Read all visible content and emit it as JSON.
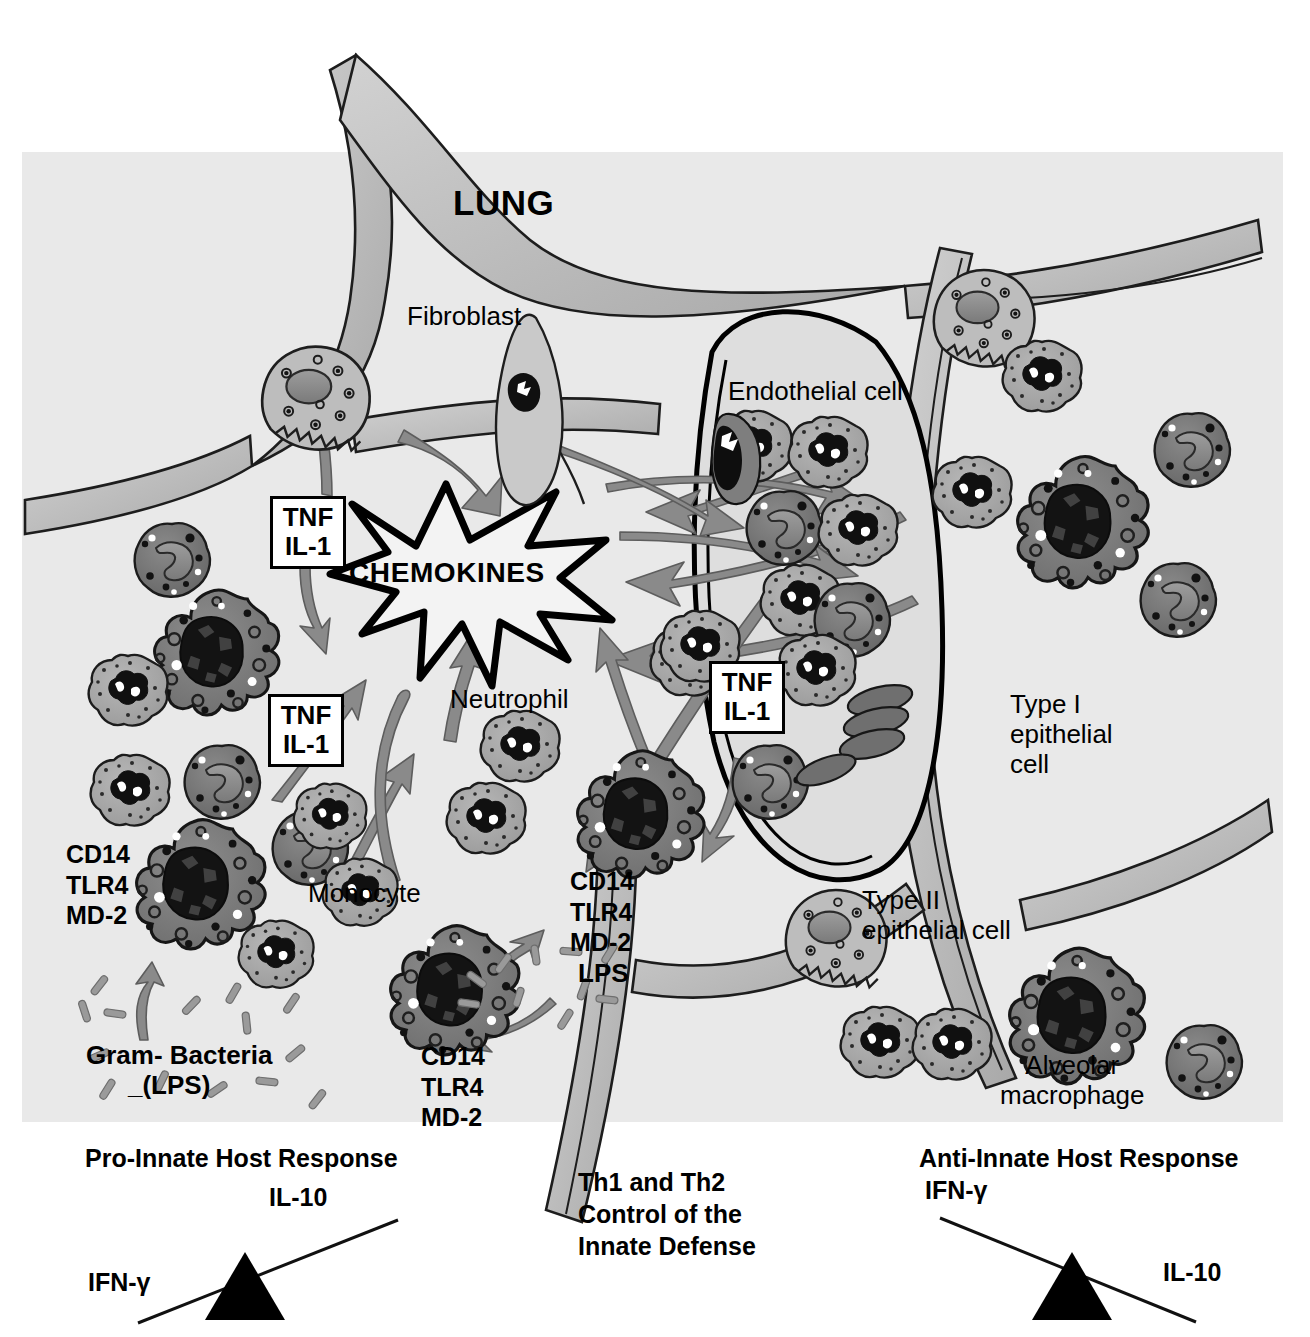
{
  "figure": {
    "title": "LUNG",
    "background_color": "#e9e9e9",
    "page_color": "#ffffff",
    "ink_color": "#000000",
    "arrow_color": "#8a8a8a"
  },
  "labels": {
    "lung": "LUNG",
    "fibroblast": "Fibroblast",
    "endothelial_cell": "Endothelial cell",
    "neutrophil": "Neutrophil",
    "monocyte": "Monocyte",
    "type1_epithelial": "Type I\nepithelial\ncell",
    "type2_epithelial": "Type II\nepithelial cell",
    "alveolar_macrophage": "Alveolar\nmacrophage",
    "chemokines": "CHEMOKINES",
    "lps": "LPS",
    "gram_bacteria": "Gram- Bacteria",
    "gram_bacteria_lps": "_(LPS)"
  },
  "receptor_clusters": [
    {
      "id": "left-macrophage",
      "lines": "CD14\nTLR4\nMD-2"
    },
    {
      "id": "center-macrophage",
      "lines": "CD14\nTLR4\nMD-2"
    },
    {
      "id": "right-macrophage",
      "lines": "CD14\nTLR4\nMD-2"
    }
  ],
  "cytokine_boxes": [
    {
      "id": "fibroblast-cytokines",
      "line1": "TNF",
      "line2": "IL-1"
    },
    {
      "id": "monocyte-cytokines",
      "line1": "TNF",
      "line2": "IL-1"
    },
    {
      "id": "endothelial-cytokines",
      "line1": "TNF",
      "line2": "IL-1"
    }
  ],
  "footer": {
    "left": {
      "heading": "Pro-Innate Host Response",
      "high_side_label": "IL-10",
      "low_side_label": "IFN-γ",
      "tilt": "up-to-the-right"
    },
    "center": {
      "line1": "Th1 and Th2",
      "line2": "Control of the",
      "line3": "Innate Defense"
    },
    "right": {
      "heading": "Anti-Innate Host Response",
      "high_side_label": "IFN-γ",
      "low_side_label": "IL-10",
      "tilt": "down-to-the-right"
    }
  }
}
